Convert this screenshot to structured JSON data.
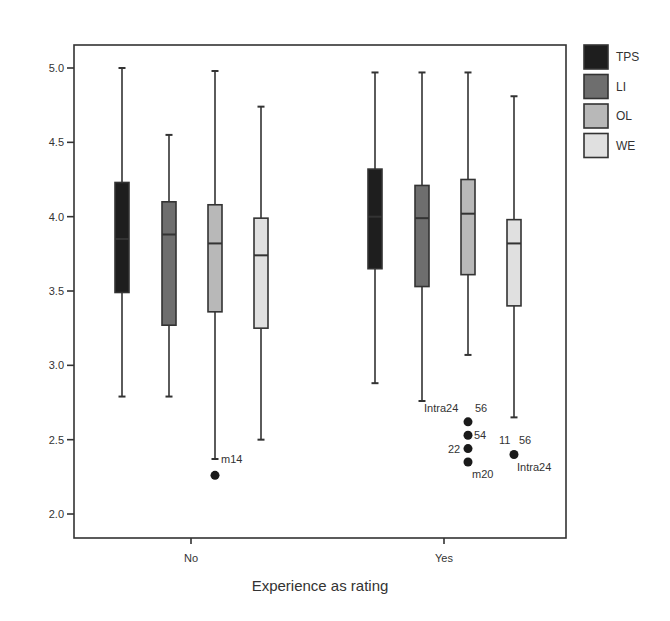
{
  "chart_data": {
    "type": "boxplot",
    "title": "",
    "xlabel": "Experience as rating",
    "ylabel": "",
    "ylim": [
      2.0,
      5.0
    ],
    "yticks": [
      "2.0",
      "2.5",
      "3.0",
      "3.5",
      "4.0",
      "4.5",
      "5.0"
    ],
    "categories": [
      "No",
      "Yes"
    ],
    "grid": false,
    "legend_position": "right-top",
    "series": [
      {
        "name": "TPS",
        "color": "#1e1e1e",
        "boxes": [
          {
            "category": "No",
            "whisker_low": 2.79,
            "q1": 3.49,
            "median": 3.85,
            "q3": 4.23,
            "whisker_high": 5.0,
            "outliers": []
          },
          {
            "category": "Yes",
            "whisker_low": 2.88,
            "q1": 3.65,
            "median": 4.0,
            "q3": 4.32,
            "whisker_high": 4.97,
            "outliers": []
          }
        ]
      },
      {
        "name": "LI",
        "color": "#6e6e6e",
        "boxes": [
          {
            "category": "No",
            "whisker_low": 2.79,
            "q1": 3.27,
            "median": 3.88,
            "q3": 4.1,
            "whisker_high": 4.55,
            "outliers": []
          },
          {
            "category": "Yes",
            "whisker_low": 2.76,
            "q1": 3.53,
            "median": 3.99,
            "q3": 4.21,
            "whisker_high": 4.97,
            "outliers": []
          }
        ]
      },
      {
        "name": "OL",
        "color": "#b8b8b8",
        "boxes": [
          {
            "category": "No",
            "whisker_low": 2.37,
            "q1": 3.36,
            "median": 3.82,
            "q3": 4.08,
            "whisker_high": 4.98,
            "outliers": [
              {
                "value": 2.26,
                "labels": [
                  {
                    "text": "m14",
                    "dx": 6,
                    "dy": -12
                  }
                ]
              }
            ]
          },
          {
            "category": "Yes",
            "whisker_low": 3.07,
            "q1": 3.61,
            "median": 4.02,
            "q3": 4.25,
            "whisker_high": 4.97,
            "outliers": [
              {
                "value": 2.62,
                "labels": [
                  {
                    "text": "Intra24",
                    "dx": -44,
                    "dy": -10
                  },
                  {
                    "text": "56",
                    "dx": 7,
                    "dy": -10
                  }
                ]
              },
              {
                "value": 2.53,
                "labels": [
                  {
                    "text": "54",
                    "dx": 6,
                    "dy": 4
                  }
                ]
              },
              {
                "value": 2.44,
                "labels": [
                  {
                    "text": "22",
                    "dx": -20,
                    "dy": 4
                  }
                ]
              },
              {
                "value": 2.35,
                "labels": [
                  {
                    "text": "m20",
                    "dx": 4,
                    "dy": 16
                  }
                ]
              }
            ]
          }
        ]
      },
      {
        "name": "WE",
        "color": "#e0e0e0",
        "boxes": [
          {
            "category": "No",
            "whisker_low": 2.5,
            "q1": 3.25,
            "median": 3.74,
            "q3": 3.99,
            "whisker_high": 4.74,
            "outliers": []
          },
          {
            "category": "Yes",
            "whisker_low": 2.65,
            "q1": 3.4,
            "median": 3.82,
            "q3": 3.98,
            "whisker_high": 4.81,
            "outliers": [
              {
                "value": 2.4,
                "labels": [
                  {
                    "text": "11",
                    "dx": -15,
                    "dy": -11
                  },
                  {
                    "text": "56",
                    "dx": 5,
                    "dy": -11
                  },
                  {
                    "text": "Intra24",
                    "dx": 3,
                    "dy": 16
                  }
                ]
              }
            ]
          }
        ]
      }
    ]
  },
  "layout": {
    "frame": {
      "left": 74,
      "top": 45,
      "right": 566,
      "bottom": 538
    },
    "y_px_at_max": 68,
    "y_px_per_unit": 148.67,
    "category_centers": {
      "No": 191,
      "Yes": 444
    },
    "series_offsets": [
      -69,
      -22,
      24,
      70
    ],
    "box_width": 14,
    "legend": {
      "x": 584,
      "y": 45,
      "swatch": 24,
      "gap": 29.5
    }
  }
}
